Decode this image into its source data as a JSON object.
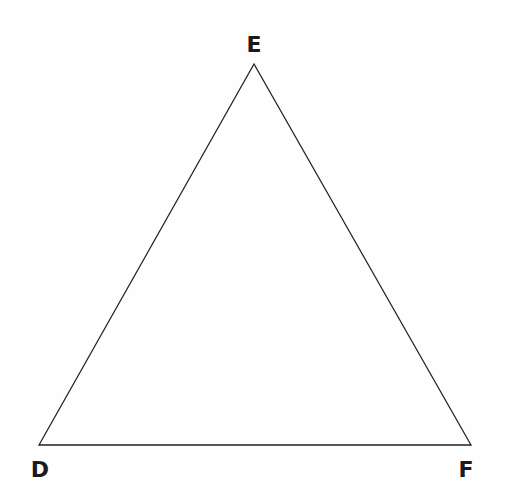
{
  "diagram": {
    "type": "triangle",
    "stroke_color": "#222222",
    "stroke_width": 1.3,
    "fill": "none",
    "vertices": [
      {
        "name": "E",
        "x": 254,
        "y": 64,
        "label": "E",
        "label_x": 254,
        "label_y": 52
      },
      {
        "name": "D",
        "x": 39,
        "y": 445,
        "label": "D",
        "label_x": 40,
        "label_y": 477
      },
      {
        "name": "F",
        "x": 471,
        "y": 445,
        "label": "F",
        "label_x": 466,
        "label_y": 477
      }
    ],
    "edges": [
      {
        "from": "D",
        "to": "E",
        "name": "edge-de"
      },
      {
        "from": "E",
        "to": "F",
        "name": "edge-ef"
      },
      {
        "from": "F",
        "to": "D",
        "name": "edge-fd"
      }
    ]
  }
}
